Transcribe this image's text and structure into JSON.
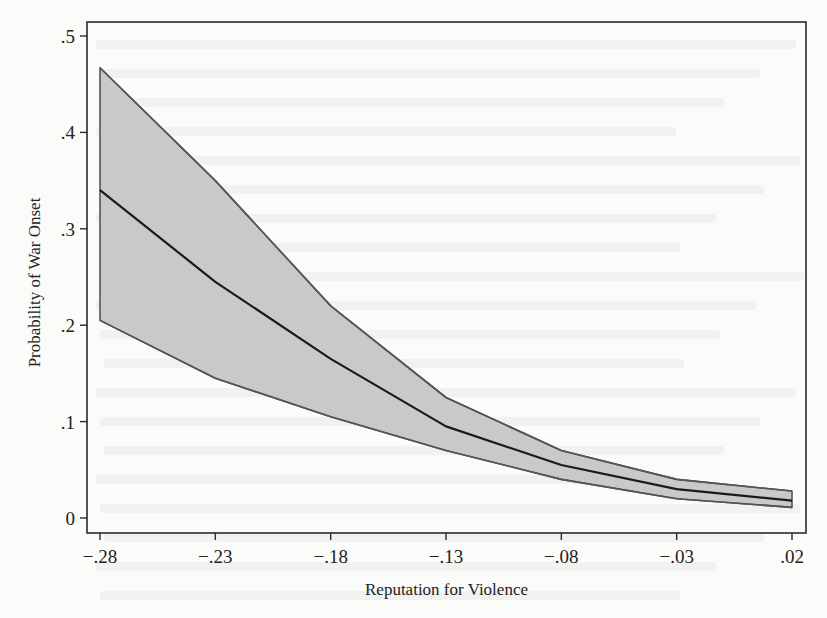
{
  "chart_data": {
    "type": "line",
    "subtype": "line-with-confidence-band",
    "title": "",
    "xlabel": "Reputation for Violence",
    "ylabel": "Probability of War Onset",
    "x": [
      -0.28,
      -0.23,
      -0.18,
      -0.13,
      -0.08,
      -0.03,
      0.02
    ],
    "x_tick_labels": [
      "−.28",
      "−.23",
      "−.18",
      "−.13",
      "−.08",
      "−.03",
      ".02"
    ],
    "y_ticks": [
      0,
      0.1,
      0.2,
      0.3,
      0.4,
      0.5
    ],
    "y_tick_labels": [
      "0",
      ".1",
      ".2",
      ".3",
      ".4",
      ".5"
    ],
    "xlim": [
      -0.286,
      0.026
    ],
    "ylim": [
      -0.008,
      0.515
    ],
    "grid": false,
    "legend": null,
    "series": [
      {
        "name": "Predicted probability",
        "role": "mean",
        "values": [
          0.34,
          0.245,
          0.165,
          0.095,
          0.055,
          0.03,
          0.018
        ]
      },
      {
        "name": "Upper confidence bound",
        "role": "upper",
        "values": [
          0.467,
          0.35,
          0.22,
          0.125,
          0.07,
          0.04,
          0.028
        ]
      },
      {
        "name": "Lower confidence bound",
        "role": "lower",
        "values": [
          0.205,
          0.145,
          0.105,
          0.07,
          0.04,
          0.02,
          0.011
        ]
      }
    ],
    "colors": {
      "band_fill": "#c9c9c7",
      "band_edge": "#555555",
      "mean_line": "#1a1a1a",
      "frame": "#2a2a2a",
      "background": "#fbfbfa"
    }
  },
  "layout": {
    "plot": {
      "left": 87,
      "top": 22,
      "right": 806,
      "bottom": 533
    },
    "x_px": {
      "min_val": -0.28,
      "min_px": 100,
      "max_val": 0.02,
      "max_px": 792
    },
    "y_px": {
      "min_val": 0,
      "min_px": 518,
      "max_val": 0.5,
      "max_px": 36
    }
  }
}
